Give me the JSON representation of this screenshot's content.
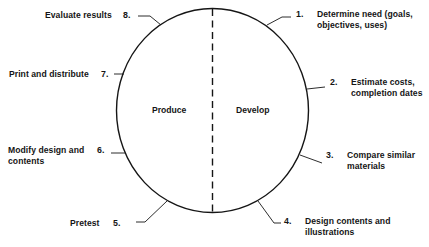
{
  "diagram": {
    "type": "cycle",
    "halves": {
      "left": "Produce",
      "right": "Develop"
    },
    "steps": [
      {
        "number": "1.",
        "line1": "Determine need (goals,",
        "line2": "objectives, uses)"
      },
      {
        "number": "2.",
        "line1": "Estimate costs,",
        "line2": "completion dates"
      },
      {
        "number": "3.",
        "line1": "Compare similar",
        "line2": "materials"
      },
      {
        "number": "4.",
        "line1": "Design contents and",
        "line2": "illustrations"
      },
      {
        "number": "5.",
        "line1": "Pretest",
        "line2": ""
      },
      {
        "number": "6.",
        "line1": "Modify design and",
        "line2": "contents"
      },
      {
        "number": "7.",
        "line1": "Print and distribute",
        "line2": ""
      },
      {
        "number": "8.",
        "line1": "Evaluate results",
        "line2": ""
      }
    ],
    "colors": {
      "ink": "#151515",
      "background": "#ffffff"
    }
  }
}
